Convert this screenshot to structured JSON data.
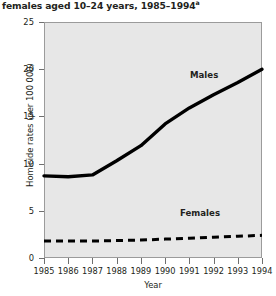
{
  "title": {
    "text": "females aged 10–24 years, 1985–1994",
    "footnote_marker": "a"
  },
  "axis_titles": {
    "y": "Homicide rates (per 100 000)",
    "x": "Year"
  },
  "series_labels": {
    "males": "Males",
    "females": "Females"
  },
  "colors": {
    "plot_background": "#e7e7e7",
    "plot_border": "#9b9b9b",
    "series_line": "#000000",
    "text": "#231f20"
  },
  "chart_data": {
    "type": "line",
    "title": "females aged 10–24 years, 1985–1994a",
    "xlabel": "Year",
    "ylabel": "Homicide rates (per 100 000)",
    "x": [
      1985,
      1986,
      1987,
      1988,
      1989,
      1990,
      1991,
      1992,
      1993,
      1994
    ],
    "xtick_labels": [
      "1985",
      "1986",
      "1987",
      "1988",
      "1989",
      "1990",
      "1991",
      "1992",
      "1993",
      "1994"
    ],
    "ytick_labels": [
      "0",
      "5",
      "10",
      "15",
      "20",
      "25"
    ],
    "yticks": [
      0,
      5,
      10,
      15,
      20,
      25
    ],
    "ylim": [
      0,
      25
    ],
    "xlim": [
      1985,
      1994
    ],
    "grid": false,
    "legend": "inline-annotations",
    "series": [
      {
        "name": "Males",
        "style": "solid",
        "color": "#000000",
        "linewidth": 3.4,
        "values": [
          8.7,
          8.6,
          8.8,
          10.3,
          11.9,
          14.2,
          15.9,
          17.3,
          18.6,
          20.0
        ]
      },
      {
        "name": "Females",
        "style": "dashed",
        "color": "#000000",
        "linewidth": 3.0,
        "values": [
          1.8,
          1.8,
          1.8,
          1.85,
          1.9,
          2.0,
          2.1,
          2.2,
          2.3,
          2.4
        ]
      }
    ]
  }
}
